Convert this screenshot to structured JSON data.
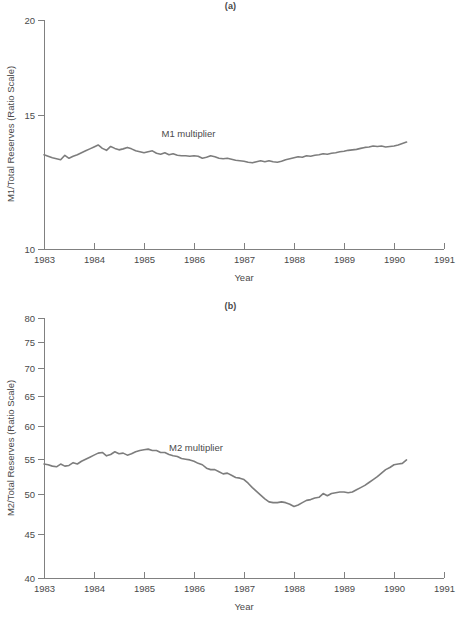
{
  "figure": {
    "panel_a_label": "(a)",
    "panel_b_label": "(b)"
  },
  "chart_data": [
    {
      "id": "panel-a",
      "type": "line",
      "title": "(a)",
      "xlabel": "Year",
      "ylabel": "M1/Total Reserves (Ratio Scale)",
      "yscale": "log",
      "ylim": [
        10,
        20
      ],
      "yticks": [
        10,
        15,
        20
      ],
      "xlim": [
        1983,
        1991
      ],
      "xticks": [
        1983,
        1984,
        1985,
        1986,
        1987,
        1988,
        1989,
        1990,
        1991
      ],
      "xticklabels": [
        "1983",
        "1984",
        "1985",
        "1986",
        "1987",
        "1988",
        "1989",
        "1990",
        "1991"
      ],
      "grid": false,
      "legend": "none",
      "series": [
        {
          "name": "M1 multiplier",
          "annotation": "M1 multiplier",
          "annotation_x": 1985.35,
          "annotation_y": 14.05,
          "color": "#7d7d7d",
          "x": [
            1983.0,
            1983.083,
            1983.167,
            1983.25,
            1983.333,
            1983.417,
            1983.5,
            1983.583,
            1983.667,
            1983.75,
            1983.833,
            1983.917,
            1984.0,
            1984.083,
            1984.167,
            1984.25,
            1984.333,
            1984.417,
            1984.5,
            1984.583,
            1984.667,
            1984.75,
            1984.833,
            1984.917,
            1985.0,
            1985.083,
            1985.167,
            1985.25,
            1985.333,
            1985.417,
            1985.5,
            1985.583,
            1985.667,
            1985.75,
            1985.833,
            1985.917,
            1986.0,
            1986.083,
            1986.167,
            1986.25,
            1986.333,
            1986.417,
            1986.5,
            1986.583,
            1986.667,
            1986.75,
            1986.833,
            1986.917,
            1987.0,
            1987.083,
            1987.167,
            1987.25,
            1987.333,
            1987.417,
            1987.5,
            1987.583,
            1987.667,
            1987.75,
            1987.833,
            1987.917,
            1988.0,
            1988.083,
            1988.167,
            1988.25,
            1988.333,
            1988.417,
            1988.5,
            1988.583,
            1988.667,
            1988.75,
            1988.833,
            1988.917,
            1989.0,
            1989.083,
            1989.167,
            1989.25,
            1989.333,
            1989.417,
            1989.5,
            1989.583,
            1989.667,
            1989.75,
            1989.833,
            1989.917,
            1990.0,
            1990.083,
            1990.167,
            1990.25
          ],
          "y": [
            13.3,
            13.24,
            13.18,
            13.14,
            13.1,
            13.28,
            13.16,
            13.24,
            13.3,
            13.38,
            13.46,
            13.54,
            13.62,
            13.7,
            13.56,
            13.48,
            13.64,
            13.56,
            13.5,
            13.54,
            13.6,
            13.54,
            13.46,
            13.42,
            13.38,
            13.42,
            13.46,
            13.36,
            13.32,
            13.38,
            13.3,
            13.34,
            13.28,
            13.26,
            13.26,
            13.24,
            13.26,
            13.24,
            13.16,
            13.2,
            13.26,
            13.22,
            13.16,
            13.14,
            13.16,
            13.12,
            13.08,
            13.06,
            13.04,
            13.0,
            12.98,
            13.02,
            13.06,
            13.02,
            13.06,
            13.02,
            13.0,
            13.04,
            13.1,
            13.14,
            13.18,
            13.22,
            13.2,
            13.26,
            13.24,
            13.28,
            13.3,
            13.34,
            13.32,
            13.36,
            13.38,
            13.42,
            13.44,
            13.48,
            13.5,
            13.52,
            13.56,
            13.6,
            13.62,
            13.66,
            13.64,
            13.66,
            13.62,
            13.64,
            13.66,
            13.7,
            13.76,
            13.82
          ]
        }
      ]
    },
    {
      "id": "panel-b",
      "type": "line",
      "title": "(b)",
      "xlabel": "Year",
      "ylabel": "M2/Total Reserves (Ratio Scale)",
      "yscale": "log",
      "ylim": [
        40,
        80
      ],
      "yticks": [
        40,
        45,
        50,
        55,
        60,
        65,
        70,
        75,
        80
      ],
      "xlim": [
        1983,
        1991
      ],
      "xticks": [
        1983,
        1984,
        1985,
        1986,
        1987,
        1988,
        1989,
        1990,
        1991
      ],
      "xticklabels": [
        "1983",
        "1984",
        "1985",
        "1986",
        "1987",
        "1988",
        "1989",
        "1990",
        "1991"
      ],
      "grid": false,
      "legend": "none",
      "series": [
        {
          "name": "M2 multiplier",
          "annotation": "M2 multiplier",
          "annotation_x": 1985.5,
          "annotation_y": 56.1,
          "color": "#7d7d7d",
          "x": [
            1983.0,
            1983.083,
            1983.167,
            1983.25,
            1983.333,
            1983.417,
            1983.5,
            1983.583,
            1983.667,
            1983.75,
            1983.833,
            1983.917,
            1984.0,
            1984.083,
            1984.167,
            1984.25,
            1984.333,
            1984.417,
            1984.5,
            1984.583,
            1984.667,
            1984.75,
            1984.833,
            1984.917,
            1985.0,
            1985.083,
            1985.167,
            1985.25,
            1985.333,
            1985.417,
            1985.5,
            1985.583,
            1985.667,
            1985.75,
            1985.833,
            1985.917,
            1986.0,
            1986.083,
            1986.167,
            1986.25,
            1986.333,
            1986.417,
            1986.5,
            1986.583,
            1986.667,
            1986.75,
            1986.833,
            1986.917,
            1987.0,
            1987.083,
            1987.167,
            1987.25,
            1987.333,
            1987.417,
            1987.5,
            1987.583,
            1987.667,
            1987.75,
            1987.833,
            1987.917,
            1988.0,
            1988.083,
            1988.167,
            1988.25,
            1988.333,
            1988.417,
            1988.5,
            1988.583,
            1988.667,
            1988.75,
            1988.833,
            1988.917,
            1989.0,
            1989.083,
            1989.167,
            1989.25,
            1989.333,
            1989.417,
            1989.5,
            1989.583,
            1989.667,
            1989.75,
            1989.833,
            1989.917,
            1990.0,
            1990.083,
            1990.167,
            1990.25
          ],
          "y": [
            54.2,
            54.1,
            53.9,
            53.8,
            54.2,
            53.9,
            54.0,
            54.4,
            54.2,
            54.6,
            54.9,
            55.2,
            55.5,
            55.8,
            55.9,
            55.4,
            55.6,
            56.0,
            55.7,
            55.8,
            55.5,
            55.7,
            56.0,
            56.2,
            56.3,
            56.4,
            56.2,
            56.2,
            55.9,
            55.9,
            55.6,
            55.4,
            55.3,
            55.0,
            54.9,
            54.8,
            54.6,
            54.3,
            54.1,
            53.6,
            53.4,
            53.4,
            53.1,
            52.8,
            52.9,
            52.6,
            52.3,
            52.2,
            52.0,
            51.5,
            50.9,
            50.4,
            49.9,
            49.4,
            49.0,
            48.9,
            48.9,
            49.0,
            48.9,
            48.7,
            48.4,
            48.6,
            48.9,
            49.2,
            49.3,
            49.5,
            49.6,
            50.1,
            49.8,
            50.1,
            50.2,
            50.3,
            50.3,
            50.2,
            50.3,
            50.6,
            50.9,
            51.2,
            51.6,
            52.0,
            52.4,
            52.9,
            53.4,
            53.7,
            54.1,
            54.2,
            54.3,
            54.8
          ]
        }
      ]
    }
  ]
}
